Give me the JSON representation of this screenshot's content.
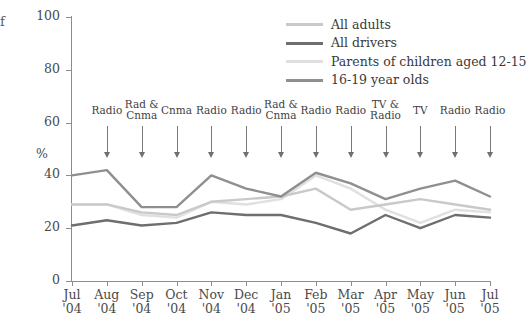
{
  "edge_fragment": "f",
  "axis": {
    "y_label": "%",
    "y_ticks": [
      0,
      20,
      40,
      60,
      80,
      100
    ],
    "y_min": 0,
    "y_max": 100,
    "x_labels": [
      {
        "month": "Jul",
        "year": "'04"
      },
      {
        "month": "Aug",
        "year": "'04"
      },
      {
        "month": "Sep",
        "year": "'04"
      },
      {
        "month": "Oct",
        "year": "'04"
      },
      {
        "month": "Nov",
        "year": "'04"
      },
      {
        "month": "Dec",
        "year": "'04"
      },
      {
        "month": "Jan",
        "year": "'05"
      },
      {
        "month": "Feb",
        "year": "'05"
      },
      {
        "month": "Mar",
        "year": "'05"
      },
      {
        "month": "Apr",
        "year": "'05"
      },
      {
        "month": "May",
        "year": "'05"
      },
      {
        "month": "Jun",
        "year": "'05"
      },
      {
        "month": "Jul",
        "year": "'05"
      }
    ]
  },
  "legend": {
    "items": [
      {
        "label": "All adults",
        "color": "#c9c9c9"
      },
      {
        "label": "All drivers",
        "color": "#6e6e6e"
      },
      {
        "label": "Parents of children aged 12-15",
        "color": "#e0e0e0"
      },
      {
        "label": "16-19 year olds",
        "color": "#8f8f8f"
      }
    ]
  },
  "annotations": [
    {
      "index": 1,
      "label": "Radio",
      "line2": ""
    },
    {
      "index": 2,
      "label": "Rad &",
      "line2": "Cnma"
    },
    {
      "index": 3,
      "label": "Cnma",
      "line2": ""
    },
    {
      "index": 4,
      "label": "Radio",
      "line2": ""
    },
    {
      "index": 5,
      "label": "Radio",
      "line2": ""
    },
    {
      "index": 6,
      "label": "Rad &",
      "line2": "Cnma"
    },
    {
      "index": 7,
      "label": "Radio",
      "line2": ""
    },
    {
      "index": 8,
      "label": "Radio",
      "line2": ""
    },
    {
      "index": 9,
      "label": "TV &",
      "line2": "Radio"
    },
    {
      "index": 10,
      "label": "TV",
      "line2": ""
    },
    {
      "index": 11,
      "label": "Radio",
      "line2": ""
    },
    {
      "index": 12,
      "label": "Radio",
      "line2": ""
    }
  ],
  "chart_data": {
    "type": "line",
    "title": "",
    "xlabel": "",
    "ylabel": "%",
    "ylim": [
      0,
      100
    ],
    "grid": false,
    "legend_position": "top-right",
    "categories": [
      "Jul '04",
      "Aug '04",
      "Sep '04",
      "Oct '04",
      "Nov '04",
      "Dec '04",
      "Jan '05",
      "Feb '05",
      "Mar '05",
      "Apr '05",
      "May '05",
      "Jun '05",
      "Jul '05"
    ],
    "series": [
      {
        "name": "All adults",
        "color": "#c9c9c9",
        "values": [
          29,
          29,
          26,
          25,
          30,
          31,
          32,
          35,
          27,
          29,
          31,
          29,
          27
        ]
      },
      {
        "name": "All drivers",
        "color": "#6e6e6e",
        "values": [
          21,
          23,
          21,
          22,
          26,
          25,
          25,
          22,
          18,
          25,
          20,
          25,
          24
        ]
      },
      {
        "name": "Parents of children aged 12-15",
        "color": "#e0e0e0",
        "values": [
          29,
          29,
          25,
          24,
          30,
          29,
          31,
          40,
          35,
          27,
          22,
          27,
          26
        ]
      },
      {
        "name": "16-19 year olds",
        "color": "#8f8f8f",
        "values": [
          40,
          42,
          28,
          28,
          40,
          35,
          32,
          41,
          37,
          31,
          35,
          38,
          32
        ]
      }
    ],
    "annotations": [
      {
        "x": "Aug '04",
        "text": "Radio"
      },
      {
        "x": "Sep '04",
        "text": "Rad & Cnma"
      },
      {
        "x": "Oct '04",
        "text": "Cnma"
      },
      {
        "x": "Nov '04",
        "text": "Radio"
      },
      {
        "x": "Dec '04",
        "text": "Radio"
      },
      {
        "x": "Jan '05",
        "text": "Rad & Cnma"
      },
      {
        "x": "Feb '05",
        "text": "Radio"
      },
      {
        "x": "Mar '05",
        "text": "Radio"
      },
      {
        "x": "Apr '05",
        "text": "TV & Radio"
      },
      {
        "x": "May '05",
        "text": "TV"
      },
      {
        "x": "Jun '05",
        "text": "Radio"
      },
      {
        "x": "Jul '05",
        "text": "Radio"
      }
    ]
  }
}
